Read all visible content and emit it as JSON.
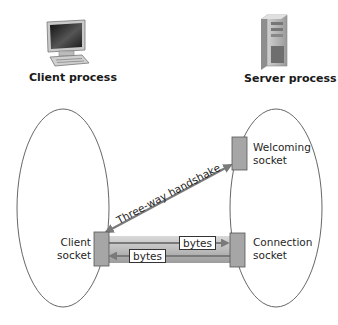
{
  "diagram": {
    "client": {
      "icon": "desktop-computer-icon",
      "title": "Client process",
      "socket_label_line1": "Client",
      "socket_label_line2": "socket"
    },
    "server": {
      "icon": "server-tower-icon",
      "title": "Server process",
      "welcoming_label_line1": "Welcoming",
      "welcoming_label_line2": "socket",
      "connection_label_line1": "Connection",
      "connection_label_line2": "socket"
    },
    "handshake_label": "Three-way handshake",
    "bytes_to_server": "bytes",
    "bytes_to_client": "bytes",
    "colors": {
      "socket_fill": "#a6a6a6",
      "arrow": "#7a7a7a",
      "pipe": "#c8c8c8",
      "ellipse_stroke": "#555555"
    }
  }
}
